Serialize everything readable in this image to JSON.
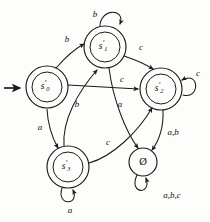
{
  "diagram": {
    "kind": "finite-state-automaton",
    "alphabet": [
      "a",
      "b",
      "c"
    ],
    "start_state": "s'_0",
    "start_marker": "incoming-arrow",
    "ink_color": "#1a1a1a",
    "background_color": "#fdfdfb"
  },
  "states": [
    {
      "id": "s0",
      "base": "s",
      "prime": "′",
      "subscript": "0",
      "accepting": true,
      "is_start": true,
      "cx": 47,
      "cy": 87,
      "r_outer": 21,
      "r_inner": 15
    },
    {
      "id": "s1",
      "base": "s",
      "prime": "′",
      "subscript": "1",
      "accepting": true,
      "is_start": false,
      "cx": 105,
      "cy": 47,
      "r_outer": 21,
      "r_inner": 15
    },
    {
      "id": "s2",
      "base": "s",
      "prime": "′",
      "subscript": "2",
      "accepting": true,
      "is_start": false,
      "cx": 161,
      "cy": 89,
      "r_outer": 21,
      "r_inner": 15
    },
    {
      "id": "s3",
      "base": "s",
      "prime": "′",
      "subscript": "3",
      "accepting": true,
      "is_start": false,
      "cx": 68,
      "cy": 167,
      "r_outer": 21,
      "r_inner": 15
    },
    {
      "id": "empty",
      "base": "Ø",
      "prime": "",
      "subscript": "",
      "accepting": false,
      "is_start": false,
      "cx": 143,
      "cy": 162,
      "r_outer": 14,
      "r_inner": 0
    }
  ],
  "transitions": [
    {
      "id": "t-s0-s1",
      "from": "s0",
      "to": "s1",
      "label": "b",
      "label_x": 67,
      "label_y": 40
    },
    {
      "id": "t-s0-s2",
      "from": "s0",
      "to": "s2",
      "label": "c",
      "label_x": 122,
      "label_y": 80
    },
    {
      "id": "t-s0-s3",
      "from": "s0",
      "to": "s3",
      "label": "a",
      "label_x": 40,
      "label_y": 128
    },
    {
      "id": "t-s1-s1-loop",
      "from": "s1",
      "to": "s1",
      "label": "b",
      "label_x": 95,
      "label_y": 15
    },
    {
      "id": "t-s1-s2",
      "from": "s1",
      "to": "s2",
      "label": "c",
      "label_x": 141,
      "label_y": 48
    },
    {
      "id": "t-s1-empty",
      "from": "s1",
      "to": "empty",
      "label": "a",
      "label_x": 120,
      "label_y": 105
    },
    {
      "id": "t-s2-s2-loop",
      "from": "s2",
      "to": "s2",
      "label": "c",
      "label_x": 198,
      "label_y": 74
    },
    {
      "id": "t-s2-empty",
      "from": "s2",
      "to": "empty",
      "label": "a,b",
      "label_x": 173,
      "label_y": 133
    },
    {
      "id": "t-s3-s1",
      "from": "s3",
      "to": "s1",
      "label": "b",
      "label_x": 77,
      "label_y": 105
    },
    {
      "id": "t-s3-s2",
      "from": "s3",
      "to": "s2",
      "label": "c",
      "label_x": 108,
      "label_y": 143
    },
    {
      "id": "t-s3-s3-loop",
      "from": "s3",
      "to": "s3",
      "label": "a",
      "label_x": 70,
      "label_y": 211
    },
    {
      "id": "t-empty-loop",
      "from": "empty",
      "to": "empty",
      "label": "a,b,c",
      "label_x": 172,
      "label_y": 196
    }
  ]
}
